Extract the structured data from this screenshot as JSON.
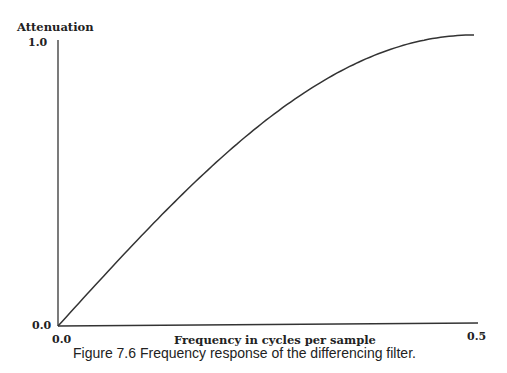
{
  "chart_data": {
    "type": "line",
    "title": "",
    "xlabel": "Frequency in cycles per sample",
    "ylabel": "Attenuation",
    "x_ticks": [
      "0.0",
      "0.5"
    ],
    "y_ticks": [
      "0.0",
      "1.0"
    ],
    "xlim": [
      0.0,
      0.5
    ],
    "ylim": [
      0.0,
      1.0
    ],
    "grid": false,
    "series": [
      {
        "name": "differencing filter",
        "x": [
          0.0,
          0.05,
          0.1,
          0.15,
          0.2,
          0.25,
          0.3,
          0.35,
          0.4,
          0.45,
          0.5
        ],
        "values": [
          0.0,
          0.156,
          0.309,
          0.454,
          0.588,
          0.707,
          0.809,
          0.891,
          0.951,
          0.988,
          1.0
        ]
      }
    ]
  },
  "caption": "Figure 7.6  Frequency response of the differencing filter."
}
